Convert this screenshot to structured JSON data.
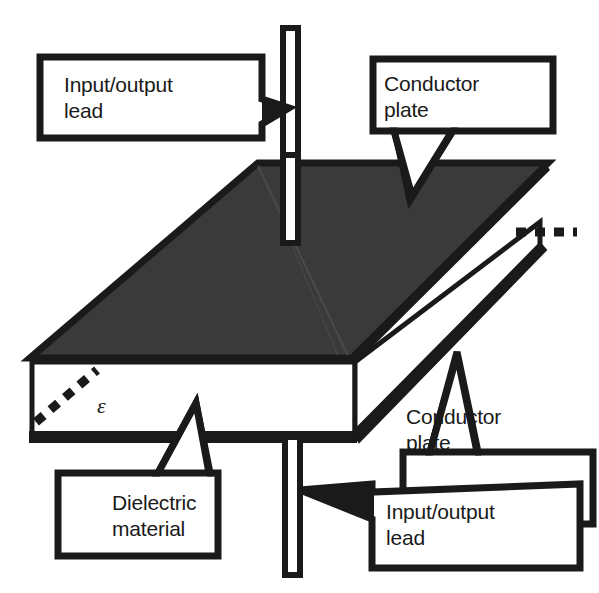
{
  "diagram": {
    "background_color": "#ffffff",
    "stroke_color": "#1a1a1a",
    "conductor_fill": "#3a3a3a",
    "dielectric_fill": "#ffffff"
  },
  "labels": {
    "lead_top": "Input/output\nlead",
    "plate_top": "Conductor\nplate",
    "dielectric": "Dielectric\nmaterial",
    "plate_bottom": "Conductor\nplate",
    "lead_bottom": "Input/output\nlead",
    "permittivity_symbol": "ε"
  },
  "parts": {
    "top_conductor_plate": "conductor-plate-top",
    "bottom_conductor_plate": "conductor-plate-bottom",
    "dielectric_slab": "dielectric-slab",
    "top_lead": "input-output-lead-top",
    "bottom_lead": "input-output-lead-bottom",
    "hidden_edge_left": "dashed-hidden-edge-left",
    "hidden_edge_right": "dashed-hidden-edge-right"
  }
}
